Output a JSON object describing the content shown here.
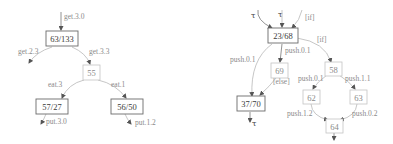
{
  "left_diagram": {
    "nodes": [
      {
        "id": "n63",
        "label": "63/133"
      },
      {
        "id": "n55",
        "label": "55"
      },
      {
        "id": "n57",
        "label": "57/27"
      },
      {
        "id": "n56",
        "label": "56/50"
      }
    ],
    "edges": [
      {
        "label": "get.3.0",
        "from": "entry",
        "to": "n63"
      },
      {
        "label": "get.2.3",
        "from": "n63",
        "to": "exit"
      },
      {
        "label": "get.3.3",
        "from": "n63",
        "to": "n55"
      },
      {
        "label": "eat.3",
        "from": "n55",
        "to": "n57"
      },
      {
        "label": "eat.1",
        "from": "n55",
        "to": "n56"
      },
      {
        "label": "put.3.0",
        "from": "n57",
        "to": "exit"
      },
      {
        "label": "put.1.2",
        "from": "n56",
        "to": "exit"
      }
    ]
  },
  "right_diagram": {
    "nodes": [
      {
        "id": "n23",
        "label": "23/68"
      },
      {
        "id": "n69",
        "label": "69"
      },
      {
        "id": "n37",
        "label": "37/70"
      },
      {
        "id": "n58",
        "label": "58"
      },
      {
        "id": "n62",
        "label": "62"
      },
      {
        "id": "n63",
        "label": "63"
      },
      {
        "id": "n64",
        "label": "64"
      }
    ],
    "edges": [
      {
        "label": "τ",
        "from": "entry",
        "to": "n23"
      },
      {
        "label": "τ",
        "from": "entry",
        "to": "n23"
      },
      {
        "label": "[if]",
        "from": "entry",
        "to": "n23"
      },
      {
        "label": "push.0.1",
        "from": "n23",
        "to": "n37"
      },
      {
        "label": "push.0.1",
        "from": "n23",
        "to": "n69"
      },
      {
        "label": "[if]",
        "from": "n23",
        "to": "n58"
      },
      {
        "label": "[else]",
        "from": "n69",
        "to": "n37"
      },
      {
        "label": "τ",
        "from": "n37",
        "to": "exit"
      },
      {
        "label": "push.0.1",
        "from": "n58",
        "to": "n62"
      },
      {
        "label": "push.1.1",
        "from": "n58",
        "to": "n63"
      },
      {
        "label": "push.1.2",
        "from": "n62",
        "to": "n64"
      },
      {
        "label": "push.0.2",
        "from": "n63",
        "to": "n64"
      }
    ]
  }
}
